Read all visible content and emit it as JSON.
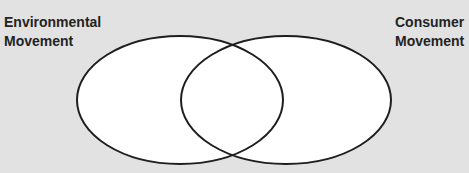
{
  "diagram": {
    "type": "venn",
    "background_color": "#e2e2e2",
    "stroke_color": "#1e1e1e",
    "fill_color": "#ffffff",
    "sets": [
      {
        "id": "environmental",
        "label_line1": "Environmental",
        "label_line2": "Movement",
        "ellipse": {
          "cx": 180,
          "cy": 100,
          "rx": 103,
          "ry": 64
        }
      },
      {
        "id": "consumer",
        "label_line1": "Consumer",
        "label_line2": "Movement",
        "ellipse": {
          "cx": 286,
          "cy": 100,
          "rx": 105,
          "ry": 64
        }
      }
    ]
  }
}
